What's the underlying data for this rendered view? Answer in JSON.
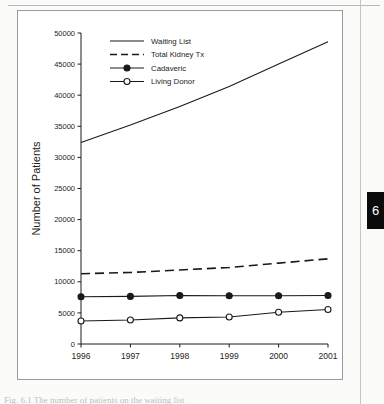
{
  "page": {
    "tab_number": "6",
    "caption": "Fig. 6.1  The number of patients on the waiting list"
  },
  "chart_data": {
    "type": "line",
    "title": "",
    "xlabel": "",
    "ylabel": "Number of Patients",
    "categories": [
      "1996",
      "1997",
      "1998",
      "1999",
      "2000",
      "2001"
    ],
    "x": [
      1996,
      1997,
      1998,
      1999,
      2000,
      2001
    ],
    "xlim": [
      1996,
      2001
    ],
    "ylim": [
      0,
      50000
    ],
    "yticks": [
      0,
      5000,
      10000,
      15000,
      20000,
      25000,
      30000,
      35000,
      40000,
      45000,
      50000
    ],
    "ytick_labels": [
      "0",
      "5000",
      "10000",
      "15000",
      "20000",
      "25000",
      "30000",
      "35000",
      "40000",
      "45000",
      "50000"
    ],
    "grid": false,
    "legend_position": "top-left",
    "series": [
      {
        "name": "Waiting List",
        "style": "solid",
        "marker": "none",
        "color": "#1a1a1a",
        "values": [
          32400,
          35200,
          38200,
          41400,
          45000,
          48600
        ]
      },
      {
        "name": "Total Kidney Tx",
        "style": "dashed",
        "marker": "none",
        "color": "#1a1a1a",
        "values": [
          11300,
          11500,
          11900,
          12300,
          13000,
          13700
        ]
      },
      {
        "name": "Cadaveric",
        "style": "solid",
        "marker": "filled-circle",
        "color": "#1a1a1a",
        "values": [
          7600,
          7650,
          7800,
          7750,
          7750,
          7800
        ]
      },
      {
        "name": "Living Donor",
        "style": "solid",
        "marker": "open-circle",
        "color": "#1a1a1a",
        "values": [
          3700,
          3850,
          4200,
          4350,
          5100,
          5550
        ]
      }
    ]
  }
}
